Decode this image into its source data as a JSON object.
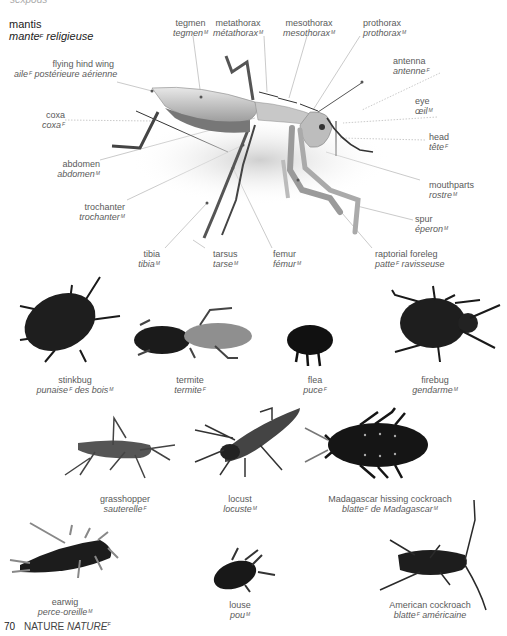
{
  "header": {
    "cut_text": "sexpods",
    "title_en": "mantis",
    "title_fr": "mante",
    "title_fr_gender": "F",
    "title_fr_rest": "religieuse"
  },
  "mantis_labels": [
    {
      "id": "tegmen",
      "en": "tegmen",
      "fr": "tegmen",
      "g": "M"
    },
    {
      "id": "metathorax",
      "en": "metathorax",
      "fr": "métathorax",
      "g": "M"
    },
    {
      "id": "mesothorax",
      "en": "mesothorax",
      "fr": "mesothorax",
      "g": "M"
    },
    {
      "id": "prothorax",
      "en": "prothorax",
      "fr": "prothorax",
      "g": "M"
    },
    {
      "id": "antenna",
      "en": "antenna",
      "fr": "antenne",
      "g": "F"
    },
    {
      "id": "flying-hind-wing",
      "en": "flying hind wing",
      "fr": "aile",
      "g": "F",
      "fr_rest": "postérieure aérienne"
    },
    {
      "id": "eye",
      "en": "eye",
      "fr": "œil",
      "g": "M"
    },
    {
      "id": "coxa",
      "en": "coxa",
      "fr": "coxa",
      "g": "F"
    },
    {
      "id": "head",
      "en": "head",
      "fr": "tête",
      "g": "F"
    },
    {
      "id": "abdomen",
      "en": "abdomen",
      "fr": "abdomen",
      "g": "M"
    },
    {
      "id": "mouthparts",
      "en": "mouthparts",
      "fr": "rostre",
      "g": "M"
    },
    {
      "id": "trochanter",
      "en": "trochanter",
      "fr": "trochanter",
      "g": "M"
    },
    {
      "id": "spur",
      "en": "spur",
      "fr": "éperon",
      "g": "M"
    },
    {
      "id": "tibia",
      "en": "tibia",
      "fr": "tibia",
      "g": "M"
    },
    {
      "id": "tarsus",
      "en": "tarsus",
      "fr": "tarse",
      "g": "M"
    },
    {
      "id": "femur",
      "en": "femur",
      "fr": "fémur",
      "g": "M"
    },
    {
      "id": "raptorial-foreleg",
      "en": "raptorial foreleg",
      "fr": "patte",
      "g": "F",
      "fr_rest": "ravisseuse"
    }
  ],
  "insects": [
    {
      "id": "stinkbug",
      "en": "stinkbug",
      "fr": "punaise",
      "g": "F",
      "fr_rest": "des bois",
      "g2": "M"
    },
    {
      "id": "termite",
      "en": "termite",
      "fr": "termite",
      "g": "F"
    },
    {
      "id": "flea",
      "en": "flea",
      "fr": "puce",
      "g": "F"
    },
    {
      "id": "firebug",
      "en": "firebug",
      "fr": "gendarme",
      "g": "M"
    },
    {
      "id": "grasshopper",
      "en": "grasshopper",
      "fr": "sauterelle",
      "g": "F"
    },
    {
      "id": "locust",
      "en": "locust",
      "fr": "locuste",
      "g": "M"
    },
    {
      "id": "madagascar-cockroach",
      "en": "Madagascar hissing cockroach",
      "fr": "blatte",
      "g": "F",
      "fr_rest": "de Madagascar",
      "g2": "M"
    },
    {
      "id": "earwig",
      "en": "earwig",
      "fr": "perce-oreille",
      "g": "M"
    },
    {
      "id": "louse",
      "en": "louse",
      "fr": "pou",
      "g": "M"
    },
    {
      "id": "american-cockroach",
      "en": "American cockroach",
      "fr": "blatte",
      "g": "F",
      "fr_rest": "américaine"
    }
  ],
  "footer": {
    "page_number": "70",
    "section_en": "NATURE",
    "section_fr": "NATURE",
    "section_fr_gender": "F"
  }
}
